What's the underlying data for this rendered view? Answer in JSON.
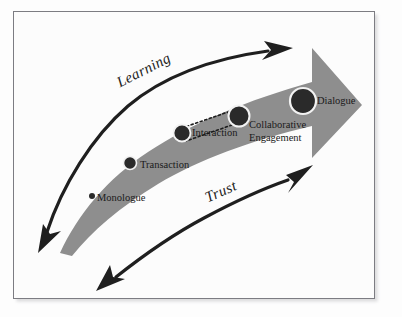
{
  "figure": {
    "frame": {
      "border_color": "#7c7c82",
      "background": "#fcfcfc"
    }
  },
  "palette": {
    "band_grey": "#8e8e8e",
    "arrow_black": "#1f1f1f",
    "node_fill": "#2a2a2a",
    "node_ring": "#f2f2f2",
    "text": "#1a1a1a"
  },
  "band": {
    "name": "growth-arrow-band",
    "description": "tapering grey arrow sweeping from lower-left to upper-right ending in block arrowhead"
  },
  "nodes": [
    {
      "id": "monologue",
      "label": "Monologue",
      "radius": 3.0,
      "x": 92,
      "y": 196
    },
    {
      "id": "transaction",
      "label": "Transaction",
      "radius": 6.5,
      "x": 130,
      "y": 163
    },
    {
      "id": "interaction",
      "label": "Interaction",
      "radius": 8.5,
      "x": 182,
      "y": 133
    },
    {
      "id": "collaborative",
      "label": "Collaborative Engagement",
      "radius": 10.5,
      "x": 239,
      "y": 116
    },
    {
      "id": "dialogue",
      "label": "Dialogue",
      "radius": 13.0,
      "x": 303,
      "y": 101
    }
  ],
  "node_labels": {
    "monologue": "Monologue",
    "transaction": "Transaction",
    "interaction": "Interaction",
    "collaborative_line1": "Collaborative",
    "collaborative_line2": "Engagement",
    "dialogue": "Dialogue"
  },
  "flow_arrows": [
    {
      "id": "learning",
      "label": "Learning",
      "position": "upper",
      "points_to": [
        "up-right",
        "down-left"
      ],
      "style": "curved double-headed black arrow"
    },
    {
      "id": "trust",
      "label": "Trust",
      "position": "lower",
      "points_to": [
        "up-right",
        "down-left"
      ],
      "style": "curved double-headed black arrow"
    }
  ],
  "highlight_box": {
    "id": "interaction-highlight",
    "style": "dotted",
    "encloses": "Interaction stage"
  }
}
